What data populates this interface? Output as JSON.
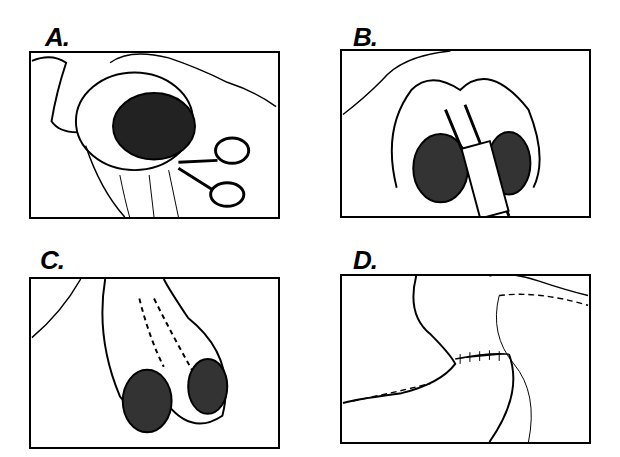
{
  "figure": {
    "panels": [
      {
        "label": "A.",
        "content": "Bowel loop end held open, mesentery being divided with scissors"
      },
      {
        "label": "B.",
        "content": "Two bowel limbs side by side with stapling device inserted into both lumens"
      },
      {
        "label": "C.",
        "content": "Two limbs joined with staple line shown as dashed line, two open lumens"
      },
      {
        "label": "D.",
        "content": "Completed anastomosis with closed suture line across bowel"
      }
    ]
  }
}
